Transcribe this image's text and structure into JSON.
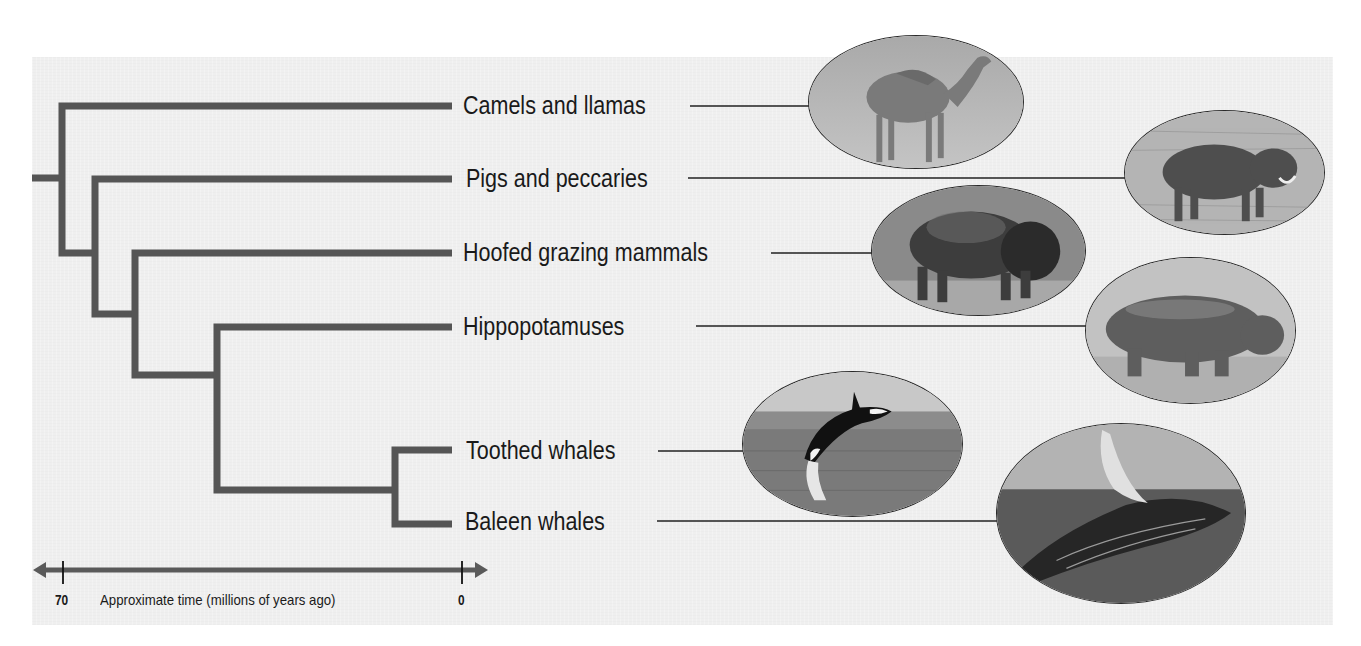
{
  "diagram": {
    "type": "phylogenetic tree",
    "branch_color": "#555555",
    "taxa": [
      {
        "label": "Camels and llamas",
        "image": "camel-photo"
      },
      {
        "label": "Pigs and peccaries",
        "image": "warthog-photo"
      },
      {
        "label": "Hoofed grazing mammals",
        "image": "bison-photo"
      },
      {
        "label": "Hippopotamuses",
        "image": "hippopotamus-photo"
      },
      {
        "label": "Toothed whales",
        "image": "orca-photo"
      },
      {
        "label": "Baleen whales",
        "image": "humpback-whale-photo"
      }
    ],
    "axis": {
      "title": "Approximate time (millions of years ago)",
      "left_tick": "70",
      "right_tick": "0"
    }
  }
}
